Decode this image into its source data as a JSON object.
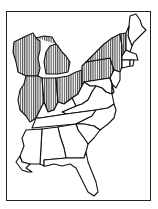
{
  "map": {
    "type": "range-map",
    "region": "Eastern United States",
    "style": "black outline, vertical hatching for range",
    "colors": {
      "outline": "#111111",
      "hatch": "#222222",
      "background": "#ffffff"
    },
    "range_states": [
      "Wisconsin",
      "Michigan",
      "Illinois",
      "Indiana",
      "Ohio",
      "Pennsylvania",
      "New York",
      "Vermont"
    ],
    "other_states": [
      "Maine",
      "New Hampshire",
      "Massachusetts",
      "Connecticut",
      "Rhode Island",
      "New Jersey",
      "Delaware",
      "Maryland",
      "West Virginia",
      "Virginia",
      "Kentucky",
      "Tennessee",
      "North Carolina",
      "South Carolina",
      "Georgia",
      "Alabama",
      "Mississippi",
      "Florida"
    ]
  }
}
